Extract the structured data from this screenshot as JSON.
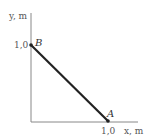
{
  "diagram": {
    "y_axis_label": "y, m",
    "x_axis_label": "x, m",
    "y_tick": "1,0",
    "x_tick": "1,0",
    "points": [
      {
        "name": "B",
        "x": 0,
        "y": 1.0
      },
      {
        "name": "A",
        "x": 1.0,
        "y": 0
      }
    ],
    "colors": {
      "axis": "#888888",
      "segment": "#222222",
      "text": "#555555"
    }
  }
}
